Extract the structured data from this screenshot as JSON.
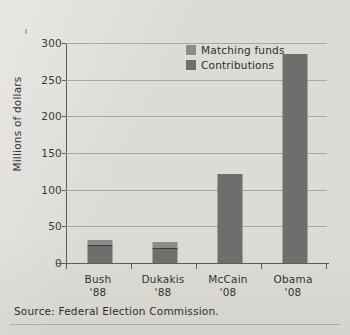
{
  "caption": {
    "source": "Source: Federal Election Commission."
  },
  "chart_data": {
    "type": "bar",
    "subtype": "stacked-bar",
    "title": "",
    "xlabel": "",
    "ylabel": "Millions of dollars",
    "ylim": [
      0,
      300
    ],
    "ytick_labels": [
      "300",
      "250",
      "200",
      "150",
      "100",
      "50",
      "0"
    ],
    "ytick_values": [
      300,
      250,
      200,
      150,
      100,
      50,
      0
    ],
    "grid": true,
    "legend_position": "upper-center",
    "categories": [
      "Bush '88",
      "Dukakis '88",
      "McCain '08",
      "Obama '08"
    ],
    "category_lines": [
      {
        "name": "Bush",
        "year": "'88"
      },
      {
        "name": "Dukakis",
        "year": "'88"
      },
      {
        "name": "McCain",
        "year": "'08"
      },
      {
        "name": "Obama",
        "year": "'08"
      }
    ],
    "series": [
      {
        "name": "Contributions",
        "color": "#6e6e6c",
        "values": [
          23,
          19,
          122,
          285
        ]
      },
      {
        "name": "Matching funds",
        "color": "#8b8b88",
        "values": [
          9,
          10,
          0,
          0
        ]
      }
    ],
    "totals": [
      32,
      29,
      122,
      285
    ],
    "legend": [
      "Matching funds",
      "Contributions"
    ]
  }
}
